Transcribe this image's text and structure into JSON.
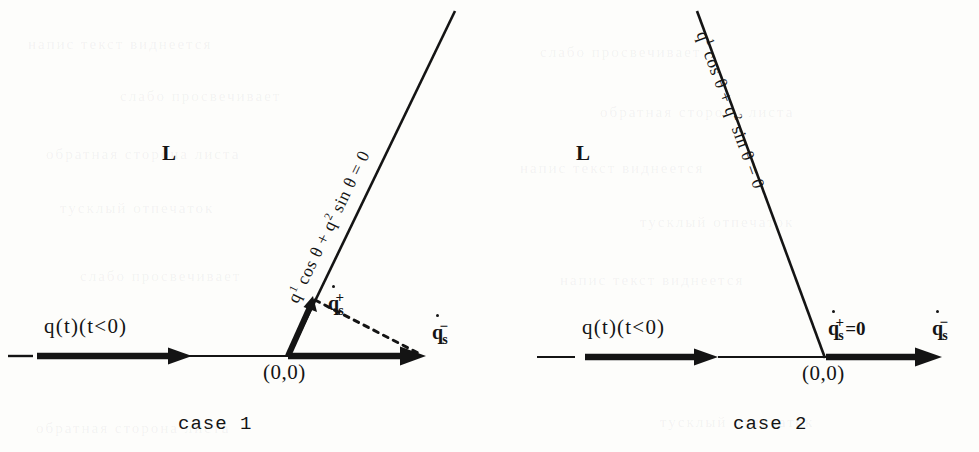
{
  "figure": {
    "background_color": "#fdfdfb",
    "ink_color": "#141414",
    "width": 979,
    "height": 452
  },
  "panels": [
    {
      "id": "case1",
      "caption": "case  1",
      "region_label": "L",
      "switching_line_equation": {
        "full": "q¹ cos θ + q² sin θ = 0",
        "part1_q": "q",
        "part1_sup": "1",
        "part2": " cos θ + ",
        "part3_q": "q",
        "part3_sup": "2",
        "part4": " sin θ = 0"
      },
      "trajectory_label": "q(t)(t<0)",
      "origin_label": "(0,0)",
      "vector_plus_label": "q̇s+",
      "vector_minus_label": "q̇s−",
      "vector_plus_value": "",
      "vector_plus_nonzero": true
    },
    {
      "id": "case2",
      "caption": "case  2",
      "region_label": "L",
      "switching_line_equation": {
        "full": "q¹ cos θ + q² sin θ = 0",
        "part1_q": "q",
        "part1_sup": "1",
        "part2": " cos θ + ",
        "part3_q": "q",
        "part3_sup": "2",
        "part4": " sin θ = 0"
      },
      "trajectory_label": "q(t)(t<0)",
      "origin_label": "(0,0)",
      "vector_plus_label": "q̇s+",
      "vector_minus_label": "q̇s−",
      "vector_plus_value": "=0",
      "vector_plus_nonzero": false
    }
  ],
  "glyphs": {
    "q": "q",
    "s": "s",
    "plus": "+",
    "minus": "−",
    "eq_zero": "=0",
    "theta": "θ",
    "cos": "cos",
    "sin": "sin"
  },
  "ghost_text": [
    "напис текст виднеется",
    "слабо просвечивает",
    "обратная сторона листа",
    "тусклый отпечаток"
  ]
}
